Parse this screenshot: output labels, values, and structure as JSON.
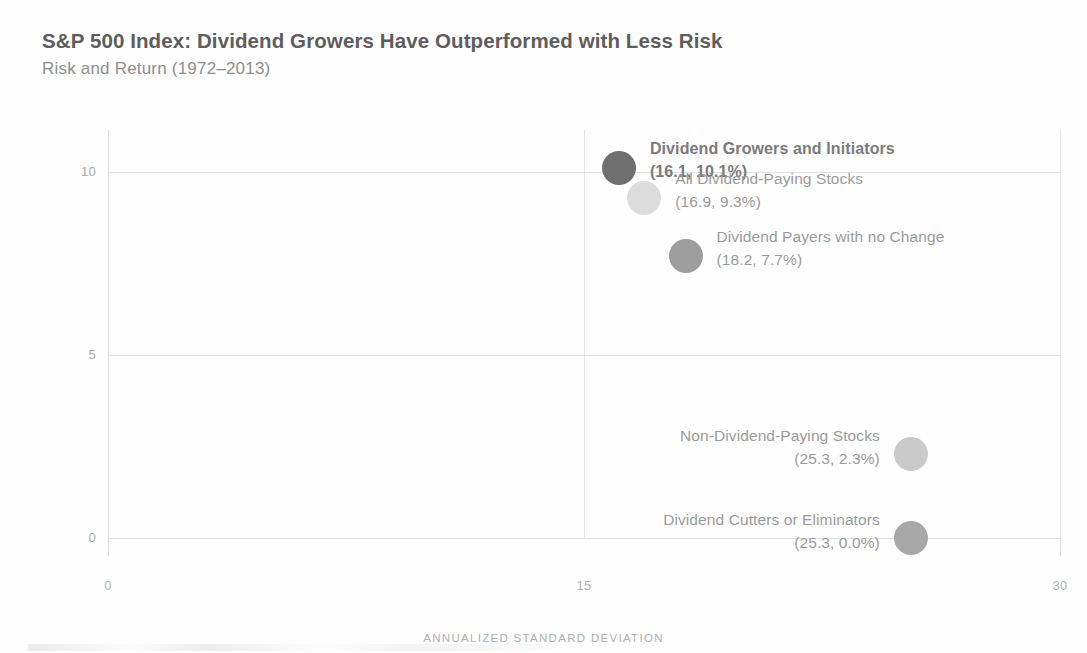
{
  "header": {
    "title": "S&P 500 Index: Dividend Growers Have Outperformed with Less Risk",
    "subtitle": "Risk and Return (1972–2013)"
  },
  "chart_data": {
    "type": "scatter",
    "title": "S&P 500 Index: Dividend Growers Have Outperformed with Less Risk",
    "subtitle": "Risk and Return (1972–2013)",
    "xlabel": "ANNUALIZED STANDARD DEVIATION",
    "ylabel": "AVERAGE ANNUALIZED RETURN (%)",
    "xlim": [
      0,
      30
    ],
    "ylim": [
      0,
      11.2
    ],
    "xticks": [
      "0",
      "15",
      "30"
    ],
    "xtick_values": [
      0,
      15,
      30
    ],
    "yticks": [
      "0",
      "5",
      "10"
    ],
    "ytick_values": [
      0,
      5,
      10
    ],
    "grid": true,
    "legend": "none",
    "points": [
      {
        "name": "Dividend Growers and Initiators",
        "x": 16.1,
        "y": 10.1,
        "value_label": "(16.1, 10.1%)",
        "color": "#6f6f6f",
        "size": 34,
        "emphasis": true,
        "label_align": "left"
      },
      {
        "name": "All Dividend-Paying Stocks",
        "x": 16.9,
        "y": 9.3,
        "value_label": "(16.9, 9.3%)",
        "color": "#dcdcdc",
        "size": 34,
        "emphasis": false,
        "label_align": "left"
      },
      {
        "name": "Dividend Payers with no Change",
        "x": 18.2,
        "y": 7.7,
        "value_label": "(18.2, 7.7%)",
        "color": "#9d9d9d",
        "size": 34,
        "emphasis": false,
        "label_align": "left"
      },
      {
        "name": "Non-Dividend-Paying Stocks",
        "x": 25.3,
        "y": 2.3,
        "value_label": "(25.3, 2.3%)",
        "color": "#cacaca",
        "size": 34,
        "emphasis": false,
        "label_align": "right"
      },
      {
        "name": "Dividend Cutters or Eliminators",
        "x": 25.3,
        "y": 0.0,
        "value_label": "(25.3, 0.0%)",
        "color": "#a8a8a8",
        "size": 34,
        "emphasis": false,
        "label_align": "right"
      }
    ]
  },
  "colors": {
    "title": "#5d5d5d",
    "subtitle": "#8e8e8e",
    "grid": "#e2e2e2",
    "axis_text": "#aeaeae"
  }
}
